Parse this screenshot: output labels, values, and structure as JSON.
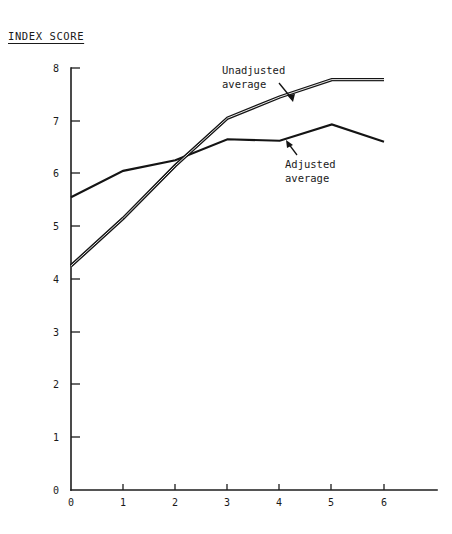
{
  "chart_data": {
    "type": "line",
    "title": "INDEX SCORE",
    "xlabel": "",
    "ylabel": "",
    "xlim": [
      0,
      6
    ],
    "ylim": [
      0,
      8
    ],
    "grid": false,
    "legend_position": "inline-annotation",
    "x": [
      0,
      1,
      2,
      3,
      4,
      5,
      6
    ],
    "xtick_labels": [
      "0",
      "1",
      "2",
      "3",
      "4",
      "5",
      "6"
    ],
    "ytick_labels": [
      "0",
      "1",
      "2",
      "3",
      "4",
      "5",
      "6",
      "7",
      "8"
    ],
    "ytick_values": [
      0,
      1,
      2,
      3,
      4,
      5,
      6,
      7,
      8
    ],
    "series": [
      {
        "name": "Unadjusted average",
        "style": "double-stroke",
        "values": [
          4.25,
          5.15,
          6.15,
          7.05,
          7.45,
          7.78,
          7.78
        ]
      },
      {
        "name": "Adjusted average",
        "style": "single-stroke",
        "values": [
          5.55,
          6.05,
          6.25,
          6.65,
          6.62,
          6.93,
          6.6
        ]
      }
    ],
    "annotations": [
      {
        "id": "unadjusted",
        "text_line1": "Unadjusted",
        "text_line2": "average",
        "points_to_series": "Unadjusted average"
      },
      {
        "id": "adjusted",
        "text_line1": "Adjusted",
        "text_line2": "average",
        "points_to_series": "Adjusted average"
      }
    ]
  },
  "colors": {
    "background": "#ffffff",
    "ink": "#141414",
    "axis": "#1d1d1d"
  }
}
